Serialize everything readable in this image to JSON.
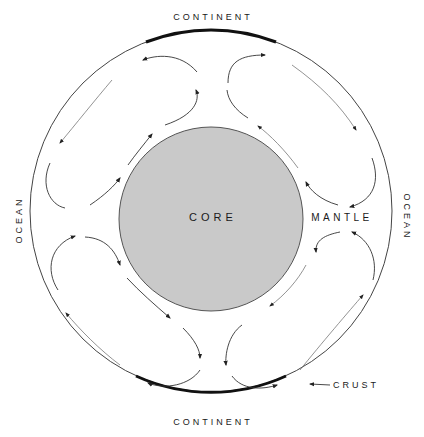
{
  "diagram": {
    "labels": {
      "continent_top": "CONTINENT",
      "continent_bottom": "CONTINENT",
      "ocean_left": "OCEAN",
      "ocean_right": "OCEAN",
      "core": "CORE",
      "mantle": "MANTLE",
      "crust": "CRUST"
    },
    "colors": {
      "core_fill": "#c9c9c9",
      "core_stroke": "#555555",
      "crust_stroke": "#444444",
      "continent_stroke": "#111111",
      "arrow_stroke": "#333333",
      "background": "#ffffff"
    },
    "geometry": {
      "outer_circle": {
        "cx": 211,
        "cy": 211,
        "r": 181
      },
      "core_circle": {
        "cx": 211,
        "cy": 219,
        "r": 92
      }
    },
    "convection_cells": [
      {
        "quadrant": "upper-left",
        "rotation": "counter-clockwise"
      },
      {
        "quadrant": "upper-right",
        "rotation": "clockwise"
      },
      {
        "quadrant": "lower-left",
        "rotation": "clockwise"
      },
      {
        "quadrant": "lower-right",
        "rotation": "counter-clockwise"
      }
    ]
  }
}
